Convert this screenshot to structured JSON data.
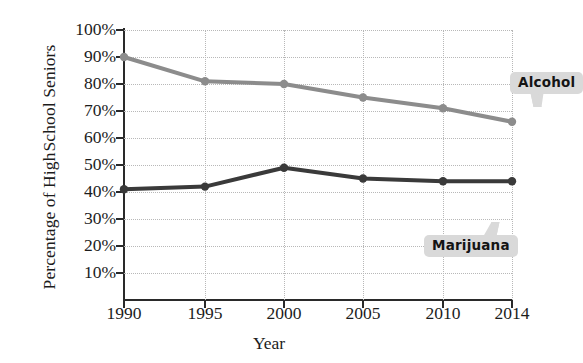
{
  "chart_data": {
    "type": "line",
    "title": "",
    "xlabel": "Year",
    "ylabel": "Percentage of High School Seniors",
    "ylabel_line1": "Percentage of High",
    "ylabel_line2": "School Seniors",
    "categories": [
      "1990",
      "1995",
      "2000",
      "2005",
      "2010",
      "2014"
    ],
    "x": [
      1990,
      1995,
      2000,
      2005,
      2010,
      2014
    ],
    "ylim": [
      0,
      100
    ],
    "ytick_labels": [
      "100%",
      "90%",
      "80%",
      "70%",
      "60%",
      "50%",
      "40%",
      "30%",
      "20%",
      "10%"
    ],
    "ytick_values": [
      100,
      90,
      80,
      70,
      60,
      50,
      40,
      30,
      20,
      10
    ],
    "grid": true,
    "legend_position": "inline-callouts",
    "series": [
      {
        "name": "Alcohol",
        "color": "#8c8c8c",
        "values": [
          90,
          81,
          80,
          75,
          71,
          66
        ]
      },
      {
        "name": "Marijuana",
        "color": "#3a3a3a",
        "values": [
          41,
          42,
          49,
          45,
          44,
          44
        ]
      }
    ],
    "annotations": [
      {
        "label": "Alcohol",
        "series": "Alcohol"
      },
      {
        "label": "Marijuana",
        "series": "Marijuana"
      }
    ]
  },
  "axes": {
    "x_title": "Year",
    "y_title_line1": "Percentage of High",
    "y_title_line2": "School Seniors"
  },
  "callouts": {
    "alcohol": "Alcohol",
    "marijuana": "Marijuana"
  },
  "colors": {
    "alcohol": "#8c8c8c",
    "marijuana": "#3a3a3a",
    "grid": "#b8b8b8",
    "axis": "#2a2a2a",
    "callout_bg": "#d9d9d9",
    "text": "#1c1c1c"
  }
}
